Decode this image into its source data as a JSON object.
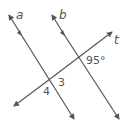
{
  "diagram": {
    "type": "parallel-lines-transversal",
    "line_color": "#555555",
    "lines": [
      {
        "id": "a",
        "label": "a",
        "parallel_marker": true
      },
      {
        "id": "b",
        "label": "b",
        "parallel_marker": true
      },
      {
        "id": "t",
        "label": "t",
        "parallel_marker": false
      }
    ],
    "angles": [
      {
        "id": "angle-95",
        "label": "95°",
        "at": "b-t intersection"
      },
      {
        "id": "angle-3",
        "label": "3",
        "at": "a-t intersection"
      },
      {
        "id": "angle-4",
        "label": "4",
        "at": "a-t intersection"
      }
    ]
  }
}
